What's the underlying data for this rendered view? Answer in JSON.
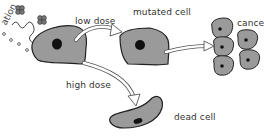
{
  "diagram": {
    "source_label": "radiation",
    "source_label_visible": "ation",
    "nodes": [
      {
        "id": "normal-cell",
        "label": ""
      },
      {
        "id": "mutated-cell",
        "label": "mutated cell"
      },
      {
        "id": "cancer",
        "label": "cancer"
      },
      {
        "id": "dead-cell",
        "label": "dead cell"
      }
    ],
    "edges": [
      {
        "from": "normal-cell",
        "to": "mutated-cell",
        "label": "low dose"
      },
      {
        "from": "normal-cell",
        "to": "dead-cell",
        "label": "high dose"
      },
      {
        "from": "mutated-cell",
        "to": "cancer",
        "label": ""
      }
    ],
    "colors": {
      "cell_fill": "#9a9a9a",
      "cell_stroke": "#222222",
      "nucleus": "#111111",
      "arrow_fill": "#ffffff",
      "arrow_stroke": "#555555",
      "particle": "#666666"
    }
  }
}
